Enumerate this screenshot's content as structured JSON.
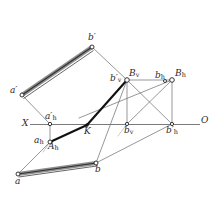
{
  "figure": {
    "kind": "descriptive-geometry-projection-diagram",
    "width": 216,
    "height": 197,
    "background": "#ffffff",
    "ink_color": "#3a3a3a",
    "thick_ink_color": "#111111",
    "axis_color": "#6e6e6e",
    "highlight_color": "#1a1a1a"
  },
  "labels": {
    "a_prime": "a′",
    "b_prime": "b′",
    "a_prime_h": "a′",
    "a_prime_h_sub": "h",
    "a_h": "a",
    "a_h_sub": "h",
    "A_h": "A",
    "A_h_sub": "h",
    "K": "K",
    "X": "X",
    "O": "O",
    "a": "a",
    "b": "b",
    "b_prime_v": "b′",
    "b_prime_v_sub": "v",
    "B_v": "B",
    "B_v_sub": "v",
    "b_v": "b",
    "b_v_sub": "v",
    "b_h": "b",
    "b_h_sub": "h",
    "B_h": "B",
    "B_h_sub": "h",
    "b_prime_h": "b′",
    "b_prime_h_sub": "h"
  },
  "points": {
    "a_prime": {
      "x": 22,
      "y": 95
    },
    "b_prime": {
      "x": 92,
      "y": 47
    },
    "a_prime_h": {
      "x": 50,
      "y": 124
    },
    "A_h": {
      "x": 50,
      "y": 142
    },
    "K": {
      "x": 87,
      "y": 125
    },
    "a": {
      "x": 18,
      "y": 174
    },
    "b": {
      "x": 96,
      "y": 163
    },
    "b_prime_v": {
      "x": 127,
      "y": 80
    },
    "B_v": {
      "x": 127,
      "y": 80
    },
    "b_v": {
      "x": 127,
      "y": 124
    },
    "b_h": {
      "x": 172,
      "y": 80
    },
    "B_h": {
      "x": 172,
      "y": 80
    },
    "b_prime_h": {
      "x": 172,
      "y": 124
    },
    "axis_left": {
      "x": 30,
      "y": 124
    },
    "axis_right": {
      "x": 200,
      "y": 124
    }
  },
  "segments": {
    "thick_band_top": "a′ b′",
    "thick_band_bottom": "a b",
    "heavy_line": "A_h to B_v through K",
    "axis": "X O ground line"
  }
}
